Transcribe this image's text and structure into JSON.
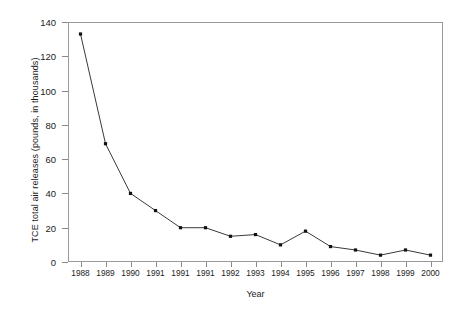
{
  "chart_data": {
    "type": "line",
    "title": "",
    "xlabel": "Year",
    "ylabel": "TCE total air releases (pounds, in thousands)",
    "categories": [
      "1988",
      "1989",
      "1990",
      "1991",
      "1991",
      "1991",
      "1992",
      "1993",
      "1994",
      "1995",
      "1996",
      "1997",
      "1998",
      "1999",
      "2000"
    ],
    "values": [
      133,
      69,
      40,
      30,
      20,
      20,
      15,
      16,
      10,
      18,
      9,
      7,
      4,
      7,
      4
    ],
    "series": [
      {
        "name": "TCE total air releases",
        "values": [
          133,
          69,
          40,
          30,
          20,
          20,
          15,
          16,
          10,
          18,
          9,
          7,
          4,
          7,
          4
        ]
      }
    ],
    "ylim": [
      0,
      140
    ],
    "yticks": [
      0,
      20,
      40,
      60,
      80,
      100,
      120,
      140
    ],
    "ytick_labels": [
      "0",
      "20",
      "40",
      "60",
      "80",
      "100",
      "120",
      "140"
    ],
    "grid": false,
    "legend": false,
    "legend_position": "none",
    "marker": "square",
    "line_color": "#3a3a3a",
    "marker_color": "#111111",
    "background_color": "#ffffff",
    "frame_color": "#9a9a9a"
  }
}
